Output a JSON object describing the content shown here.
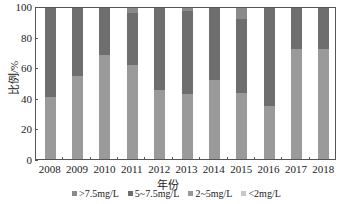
{
  "chart_data": {
    "type": "bar",
    "stacked": true,
    "title": "",
    "xlabel": "年份",
    "ylabel": "比例/%",
    "ylim": [
      0,
      100
    ],
    "yticks": [
      0,
      20,
      40,
      60,
      80,
      100
    ],
    "categories": [
      "2008",
      "2009",
      "2010",
      "2011",
      "2012",
      "2013",
      "2014",
      "2015",
      "2016",
      "2017",
      "2018"
    ],
    "series": [
      {
        "name": "<2mg/L",
        "color": "#c8c8c8",
        "values": [
          0,
          0,
          0,
          0,
          0,
          0,
          0,
          0,
          0,
          0,
          0
        ]
      },
      {
        "name": "2~5mg/L",
        "color": "#9a9a9a",
        "values": [
          41,
          55,
          69,
          62,
          46,
          43,
          52,
          44,
          35,
          73,
          73
        ]
      },
      {
        "name": "5~7.5mg/L",
        "color": "#6e6e6e",
        "values": [
          59,
          45,
          31,
          35,
          54,
          55,
          48,
          49,
          65,
          27,
          27
        ]
      },
      {
        "name": ">7.5mg/L",
        "color": "#8a8a8a",
        "values": [
          0,
          0,
          0,
          3,
          0,
          2,
          0,
          7,
          0,
          0,
          0
        ]
      }
    ],
    "legend": [
      ">7.5mg/L",
      "5~7.5mg/L",
      "2~5mg/L",
      "<2mg/L"
    ],
    "legend_position": "bottom",
    "grid": false
  }
}
